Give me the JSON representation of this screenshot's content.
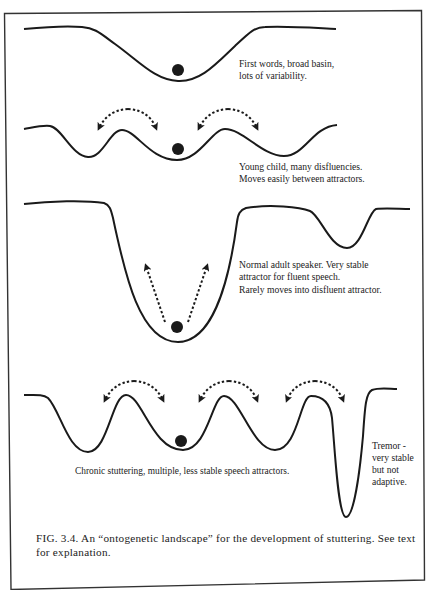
{
  "figure": {
    "frame_color": "#333333",
    "stroke_color": "#1a1a1a",
    "panels": [
      {
        "id": "first-words",
        "label_lines": [
          "First words, broad basin,",
          "lots of variability."
        ]
      },
      {
        "id": "young-child",
        "label_lines": [
          "Young child, many disfluencies.",
          "Moves easily between attractors."
        ]
      },
      {
        "id": "normal-adult",
        "label_lines": [
          "Normal adult speaker. Very stable",
          "attractor for fluent speech.",
          "Rarely moves into disfluent attractor."
        ]
      },
      {
        "id": "chronic-stuttering",
        "label_lines": [
          "Chronic stuttering, multiple, less stable speech attractors."
        ],
        "tremor_label_lines": [
          "Tremor -",
          "very stable",
          "but not",
          "adaptive."
        ]
      }
    ],
    "caption": {
      "line1": "FIG. 3.4.  An “ontogenetic landscape” for the development of stuttering.  See text",
      "line2": "for explanation."
    }
  }
}
